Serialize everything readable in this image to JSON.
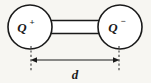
{
  "figure": {
    "background_color": "#f7f6f2",
    "stroke_color": "#1a1a1a",
    "fill_color": "#ffffff"
  },
  "charges": [
    {
      "id": "positive-charge",
      "symbol": "Q",
      "sign": "+",
      "label": "Q+",
      "center_x": 30,
      "center_y": 27,
      "radius": 22
    },
    {
      "id": "negative-charge",
      "symbol": "Q",
      "sign": "−",
      "label": "Q−",
      "center_x": 120,
      "center_y": 27,
      "radius": 22
    }
  ],
  "connector": {
    "name": "rigid-rod",
    "x_start": 48,
    "x_end": 102,
    "y_top": 20,
    "y_bottom": 33
  },
  "dimension": {
    "name": "separation-distance",
    "label": "d",
    "line_y": 60,
    "x_start": 31,
    "x_end": 119,
    "extension_top": 46,
    "extension_bottom": 72,
    "label_x": 75,
    "label_y": 79
  }
}
